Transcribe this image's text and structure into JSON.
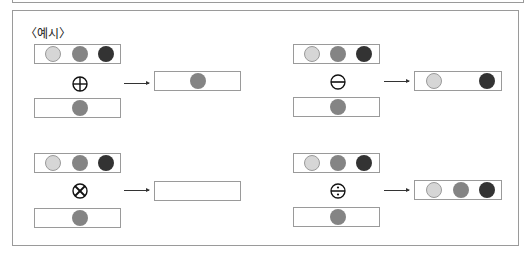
{
  "title": "〈예시〉",
  "colors": {
    "light": "#d6d6d6",
    "mid": "#848484",
    "dark": "#333333",
    "border": "#9a9a9a"
  },
  "examples": [
    {
      "operator": "plus-circle",
      "operator_symbol": "⊕",
      "input_a": [
        "light",
        "mid",
        "dark"
      ],
      "input_b": [
        "mid"
      ],
      "result": [
        "mid"
      ]
    },
    {
      "operator": "minus-circle",
      "operator_symbol": "⊖",
      "input_a": [
        "light",
        "mid",
        "dark"
      ],
      "input_b": [
        "mid"
      ],
      "result": [
        "light",
        "dark"
      ]
    },
    {
      "operator": "times-circle",
      "operator_symbol": "⊗",
      "input_a": [
        "light",
        "mid",
        "dark"
      ],
      "input_b": [
        "mid"
      ],
      "result": []
    },
    {
      "operator": "divide-circle",
      "operator_symbol": "⨸",
      "input_a": [
        "light",
        "mid",
        "dark"
      ],
      "input_b": [
        "mid"
      ],
      "result": [
        "light",
        "mid",
        "dark"
      ]
    }
  ]
}
